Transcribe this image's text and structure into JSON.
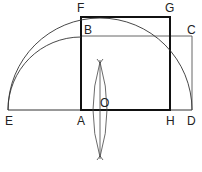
{
  "diagram": {
    "type": "golden-section-construction",
    "labels": {
      "F": "F",
      "G": "G",
      "B": "B",
      "C": "C",
      "E": "E",
      "A": "A",
      "O": "O",
      "H": "H",
      "D": "D"
    },
    "colors": {
      "stroke": "#222222",
      "background": "#ffffff"
    }
  }
}
